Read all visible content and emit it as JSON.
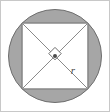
{
  "figure": {
    "canvas": {
      "width": 110,
      "height": 112,
      "background": "#ffffff"
    },
    "border": {
      "visible": true,
      "color": "#c8c8c8",
      "width": 1
    }
  },
  "colors": {
    "circle_fill": "#a6a6a6",
    "circle_stroke": "#6e6e6e",
    "square_fill": "#ffffff",
    "square_stroke": "#6b6b6b",
    "diagonal_stroke": "#8a8a8a",
    "right_angle_stroke": "#6b6b6b",
    "center_dot": "#4a4a4a",
    "label_color": "#4a4a4a"
  },
  "shapes": {
    "circle": {
      "name": "outer-circle",
      "cx": 55,
      "cy": 56,
      "r": 46.5,
      "filled": true
    },
    "square": {
      "name": "inscribed-square",
      "corners": [
        {
          "x": 22.1,
          "y": 23.1
        },
        {
          "x": 87.9,
          "y": 23.1
        },
        {
          "x": 87.9,
          "y": 88.9
        },
        {
          "x": 22.1,
          "y": 88.9
        }
      ],
      "side": 65.8
    },
    "diagonals": [
      {
        "name": "diagonal-tl-br",
        "x1": 22.1,
        "y1": 23.1,
        "x2": 87.9,
        "y2": 88.9
      },
      {
        "name": "diagonal-tr-bl",
        "x1": 87.9,
        "y1": 23.1,
        "x2": 22.1,
        "y2": 88.9
      }
    ],
    "center_point": {
      "name": "center-point",
      "cx": 55,
      "cy": 56,
      "r": 2.0
    },
    "right_angle_marker": {
      "name": "right-angle-marker",
      "points": "55,47.4 61.2,53.6 55,59.8 48.8,53.6",
      "size": 8.8
    }
  },
  "labels": {
    "radius": {
      "text": "r",
      "x": 73,
      "y": 74,
      "anchor": "middle",
      "refers_to": "radius segment from center to square corner"
    }
  }
}
